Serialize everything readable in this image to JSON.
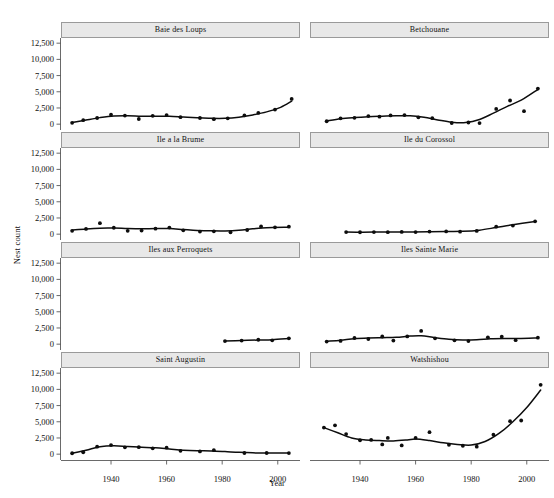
{
  "chart_data": {
    "type": "scatter",
    "title": "",
    "xlabel": "Year",
    "ylabel": "Nest count",
    "xlim": [
      1922,
      2008
    ],
    "ylim": [
      -900,
      13300
    ],
    "xticks": [
      1940,
      1960,
      1980,
      2000
    ],
    "xtick_labels": [
      "1940",
      "1960",
      "1980",
      "2000"
    ],
    "yticks": [
      0,
      2500,
      5000,
      7500,
      10000,
      12500
    ],
    "ytick_labels": [
      "0",
      "2,500",
      "5,000",
      "7,500",
      "10,000",
      "12,500"
    ],
    "grid": false,
    "legend": "none",
    "layout": {
      "rows": 4,
      "cols": 2,
      "strip_position": "top"
    },
    "panels": [
      {
        "label": "Baie des Loups",
        "row": 0,
        "col": 0,
        "points": [
          {
            "x": 1926,
            "y": 210
          },
          {
            "x": 1930,
            "y": 620
          },
          {
            "x": 1935,
            "y": 950
          },
          {
            "x": 1940,
            "y": 1450
          },
          {
            "x": 1945,
            "y": 1330
          },
          {
            "x": 1950,
            "y": 800
          },
          {
            "x": 1955,
            "y": 1290
          },
          {
            "x": 1960,
            "y": 1400
          },
          {
            "x": 1965,
            "y": 1080
          },
          {
            "x": 1972,
            "y": 950
          },
          {
            "x": 1977,
            "y": 770
          },
          {
            "x": 1982,
            "y": 900
          },
          {
            "x": 1988,
            "y": 1350
          },
          {
            "x": 1993,
            "y": 1730
          },
          {
            "x": 1999,
            "y": 2250
          },
          {
            "x": 2005,
            "y": 3900
          }
        ],
        "fit": [
          {
            "x": 1926,
            "y": 250
          },
          {
            "x": 1931,
            "y": 640
          },
          {
            "x": 1936,
            "y": 1010
          },
          {
            "x": 1941,
            "y": 1270
          },
          {
            "x": 1946,
            "y": 1310
          },
          {
            "x": 1951,
            "y": 1230
          },
          {
            "x": 1956,
            "y": 1230
          },
          {
            "x": 1961,
            "y": 1230
          },
          {
            "x": 1966,
            "y": 1110
          },
          {
            "x": 1971,
            "y": 990
          },
          {
            "x": 1976,
            "y": 900
          },
          {
            "x": 1981,
            "y": 900
          },
          {
            "x": 1986,
            "y": 1080
          },
          {
            "x": 1991,
            "y": 1430
          },
          {
            "x": 1996,
            "y": 1900
          },
          {
            "x": 2001,
            "y": 2600
          },
          {
            "x": 2005,
            "y": 3550
          }
        ]
      },
      {
        "label": "Betchouane",
        "row": 0,
        "col": 1,
        "points": [
          {
            "x": 1928,
            "y": 450
          },
          {
            "x": 1933,
            "y": 900
          },
          {
            "x": 1938,
            "y": 980
          },
          {
            "x": 1943,
            "y": 1250
          },
          {
            "x": 1947,
            "y": 1150
          },
          {
            "x": 1951,
            "y": 1350
          },
          {
            "x": 1956,
            "y": 1400
          },
          {
            "x": 1961,
            "y": 1050
          },
          {
            "x": 1966,
            "y": 930
          },
          {
            "x": 1973,
            "y": 180
          },
          {
            "x": 1979,
            "y": 260
          },
          {
            "x": 1983,
            "y": 170
          },
          {
            "x": 1989,
            "y": 2350
          },
          {
            "x": 1994,
            "y": 3650
          },
          {
            "x": 1999,
            "y": 2000
          },
          {
            "x": 2004,
            "y": 5500
          }
        ],
        "fit": [
          {
            "x": 1928,
            "y": 480
          },
          {
            "x": 1933,
            "y": 830
          },
          {
            "x": 1938,
            "y": 1020
          },
          {
            "x": 1943,
            "y": 1150
          },
          {
            "x": 1948,
            "y": 1230
          },
          {
            "x": 1953,
            "y": 1300
          },
          {
            "x": 1958,
            "y": 1300
          },
          {
            "x": 1963,
            "y": 1060
          },
          {
            "x": 1968,
            "y": 650
          },
          {
            "x": 1973,
            "y": 300
          },
          {
            "x": 1978,
            "y": 250
          },
          {
            "x": 1983,
            "y": 720
          },
          {
            "x": 1988,
            "y": 1700
          },
          {
            "x": 1993,
            "y": 2750
          },
          {
            "x": 1998,
            "y": 3700
          },
          {
            "x": 2004,
            "y": 5350
          }
        ]
      },
      {
        "label": "Ile a la Brume",
        "row": 1,
        "col": 0,
        "points": [
          {
            "x": 1926,
            "y": 520
          },
          {
            "x": 1931,
            "y": 810
          },
          {
            "x": 1936,
            "y": 1700
          },
          {
            "x": 1941,
            "y": 990
          },
          {
            "x": 1946,
            "y": 520
          },
          {
            "x": 1951,
            "y": 560
          },
          {
            "x": 1956,
            "y": 850
          },
          {
            "x": 1961,
            "y": 1020
          },
          {
            "x": 1966,
            "y": 600
          },
          {
            "x": 1972,
            "y": 400
          },
          {
            "x": 1977,
            "y": 440
          },
          {
            "x": 1983,
            "y": 300
          },
          {
            "x": 1989,
            "y": 640
          },
          {
            "x": 1994,
            "y": 1180
          },
          {
            "x": 1999,
            "y": 1060
          },
          {
            "x": 2004,
            "y": 1150
          }
        ],
        "fit": [
          {
            "x": 1926,
            "y": 620
          },
          {
            "x": 1931,
            "y": 810
          },
          {
            "x": 1936,
            "y": 930
          },
          {
            "x": 1941,
            "y": 940
          },
          {
            "x": 1946,
            "y": 870
          },
          {
            "x": 1951,
            "y": 840
          },
          {
            "x": 1956,
            "y": 870
          },
          {
            "x": 1961,
            "y": 860
          },
          {
            "x": 1966,
            "y": 720
          },
          {
            "x": 1971,
            "y": 580
          },
          {
            "x": 1976,
            "y": 510
          },
          {
            "x": 1981,
            "y": 500
          },
          {
            "x": 1986,
            "y": 600
          },
          {
            "x": 1991,
            "y": 820
          },
          {
            "x": 1996,
            "y": 1000
          },
          {
            "x": 2004,
            "y": 1080
          }
        ]
      },
      {
        "label": "Ile du Corossol",
        "row": 1,
        "col": 1,
        "points": [
          {
            "x": 1935,
            "y": 320
          },
          {
            "x": 1940,
            "y": 300
          },
          {
            "x": 1945,
            "y": 330
          },
          {
            "x": 1950,
            "y": 310
          },
          {
            "x": 1955,
            "y": 340
          },
          {
            "x": 1960,
            "y": 330
          },
          {
            "x": 1965,
            "y": 400
          },
          {
            "x": 1971,
            "y": 420
          },
          {
            "x": 1976,
            "y": 380
          },
          {
            "x": 1982,
            "y": 500
          },
          {
            "x": 1989,
            "y": 1150
          },
          {
            "x": 1995,
            "y": 1320
          },
          {
            "x": 2003,
            "y": 1980
          }
        ],
        "fit": [
          {
            "x": 1935,
            "y": 320
          },
          {
            "x": 1941,
            "y": 310
          },
          {
            "x": 1947,
            "y": 320
          },
          {
            "x": 1953,
            "y": 330
          },
          {
            "x": 1959,
            "y": 350
          },
          {
            "x": 1965,
            "y": 390
          },
          {
            "x": 1971,
            "y": 420
          },
          {
            "x": 1977,
            "y": 440
          },
          {
            "x": 1983,
            "y": 620
          },
          {
            "x": 1989,
            "y": 1030
          },
          {
            "x": 1995,
            "y": 1460
          },
          {
            "x": 2003,
            "y": 1950
          }
        ]
      },
      {
        "label": "Iles aux Perroquets",
        "row": 2,
        "col": 0,
        "points": [
          {
            "x": 1981,
            "y": 480
          },
          {
            "x": 1987,
            "y": 560
          },
          {
            "x": 1993,
            "y": 680
          },
          {
            "x": 1998,
            "y": 600
          },
          {
            "x": 2004,
            "y": 900
          }
        ],
        "fit": [
          {
            "x": 1981,
            "y": 490
          },
          {
            "x": 1987,
            "y": 570
          },
          {
            "x": 1993,
            "y": 640
          },
          {
            "x": 1998,
            "y": 690
          },
          {
            "x": 2004,
            "y": 860
          }
        ]
      },
      {
        "label": "Iles Sainte Marie",
        "row": 2,
        "col": 1,
        "points": [
          {
            "x": 1928,
            "y": 400
          },
          {
            "x": 1933,
            "y": 500
          },
          {
            "x": 1938,
            "y": 950
          },
          {
            "x": 1943,
            "y": 800
          },
          {
            "x": 1948,
            "y": 1180
          },
          {
            "x": 1952,
            "y": 560
          },
          {
            "x": 1957,
            "y": 1200
          },
          {
            "x": 1962,
            "y": 2050
          },
          {
            "x": 1967,
            "y": 900
          },
          {
            "x": 1974,
            "y": 600
          },
          {
            "x": 1979,
            "y": 480
          },
          {
            "x": 1986,
            "y": 1050
          },
          {
            "x": 1991,
            "y": 1150
          },
          {
            "x": 1996,
            "y": 620
          },
          {
            "x": 2004,
            "y": 1000
          }
        ],
        "fit": [
          {
            "x": 1928,
            "y": 440
          },
          {
            "x": 1933,
            "y": 620
          },
          {
            "x": 1938,
            "y": 850
          },
          {
            "x": 1943,
            "y": 960
          },
          {
            "x": 1948,
            "y": 1010
          },
          {
            "x": 1953,
            "y": 1060
          },
          {
            "x": 1958,
            "y": 1250
          },
          {
            "x": 1962,
            "y": 1300
          },
          {
            "x": 1967,
            "y": 1000
          },
          {
            "x": 1972,
            "y": 750
          },
          {
            "x": 1977,
            "y": 640
          },
          {
            "x": 1982,
            "y": 680
          },
          {
            "x": 1987,
            "y": 830
          },
          {
            "x": 1992,
            "y": 870
          },
          {
            "x": 1997,
            "y": 860
          },
          {
            "x": 2004,
            "y": 960
          }
        ]
      },
      {
        "label": "Saint Augustin",
        "row": 3,
        "col": 0,
        "points": [
          {
            "x": 1926,
            "y": 140
          },
          {
            "x": 1930,
            "y": 300
          },
          {
            "x": 1935,
            "y": 1150
          },
          {
            "x": 1940,
            "y": 1400
          },
          {
            "x": 1945,
            "y": 1050
          },
          {
            "x": 1950,
            "y": 1080
          },
          {
            "x": 1955,
            "y": 900
          },
          {
            "x": 1960,
            "y": 1000
          },
          {
            "x": 1965,
            "y": 520
          },
          {
            "x": 1972,
            "y": 430
          },
          {
            "x": 1977,
            "y": 620
          },
          {
            "x": 1988,
            "y": 180
          },
          {
            "x": 1996,
            "y": 180
          },
          {
            "x": 2004,
            "y": 170
          }
        ],
        "fit": [
          {
            "x": 1926,
            "y": 160
          },
          {
            "x": 1931,
            "y": 610
          },
          {
            "x": 1936,
            "y": 1150
          },
          {
            "x": 1941,
            "y": 1300
          },
          {
            "x": 1946,
            "y": 1180
          },
          {
            "x": 1951,
            "y": 1080
          },
          {
            "x": 1956,
            "y": 980
          },
          {
            "x": 1961,
            "y": 800
          },
          {
            "x": 1966,
            "y": 620
          },
          {
            "x": 1971,
            "y": 530
          },
          {
            "x": 1976,
            "y": 500
          },
          {
            "x": 1981,
            "y": 400
          },
          {
            "x": 1986,
            "y": 280
          },
          {
            "x": 1991,
            "y": 200
          },
          {
            "x": 1996,
            "y": 180
          },
          {
            "x": 2004,
            "y": 170
          }
        ]
      },
      {
        "label": "Watshishou",
        "row": 3,
        "col": 1,
        "points": [
          {
            "x": 1927,
            "y": 4100
          },
          {
            "x": 1931,
            "y": 4450
          },
          {
            "x": 1935,
            "y": 3100
          },
          {
            "x": 1940,
            "y": 2150
          },
          {
            "x": 1944,
            "y": 2200
          },
          {
            "x": 1948,
            "y": 1500
          },
          {
            "x": 1950,
            "y": 2500
          },
          {
            "x": 1955,
            "y": 1350
          },
          {
            "x": 1960,
            "y": 2500
          },
          {
            "x": 1965,
            "y": 3400
          },
          {
            "x": 1972,
            "y": 1450
          },
          {
            "x": 1977,
            "y": 1300
          },
          {
            "x": 1982,
            "y": 1150
          },
          {
            "x": 1988,
            "y": 3000
          },
          {
            "x": 1994,
            "y": 5100
          },
          {
            "x": 1998,
            "y": 5200
          },
          {
            "x": 2005,
            "y": 10700
          }
        ],
        "fit": [
          {
            "x": 1927,
            "y": 4100
          },
          {
            "x": 1932,
            "y": 3300
          },
          {
            "x": 1937,
            "y": 2500
          },
          {
            "x": 1942,
            "y": 2200
          },
          {
            "x": 1947,
            "y": 2100
          },
          {
            "x": 1952,
            "y": 2050
          },
          {
            "x": 1957,
            "y": 2200
          },
          {
            "x": 1960,
            "y": 2350
          },
          {
            "x": 1965,
            "y": 2100
          },
          {
            "x": 1970,
            "y": 1750
          },
          {
            "x": 1975,
            "y": 1500
          },
          {
            "x": 1980,
            "y": 1400
          },
          {
            "x": 1985,
            "y": 1950
          },
          {
            "x": 1990,
            "y": 3200
          },
          {
            "x": 1995,
            "y": 5000
          },
          {
            "x": 2000,
            "y": 7200
          },
          {
            "x": 2005,
            "y": 9900
          }
        ]
      }
    ]
  },
  "axes": {
    "ylabel": "Nest count",
    "xlabel": "Year"
  },
  "colors": {
    "strip_fill": "#e8e8e8",
    "strip_border": "#9a9a9a",
    "point": "#0d0d0d",
    "line": "#0d0d0d",
    "axis": "#444444",
    "background": "#ffffff"
  }
}
